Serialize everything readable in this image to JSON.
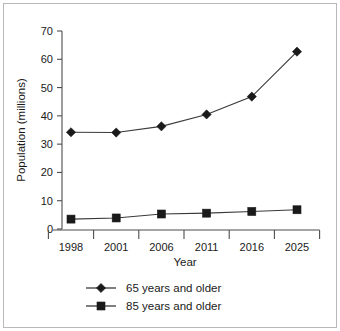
{
  "chart_data": {
    "type": "line",
    "title": "",
    "xlabel": "Year",
    "ylabel": "Population (millions)",
    "categories": [
      "1998",
      "2001",
      "2006",
      "2011",
      "2016",
      "2025"
    ],
    "ylim": [
      0,
      70
    ],
    "yticks": [
      "0",
      "10",
      "20",
      "30",
      "40",
      "50",
      "60",
      "70"
    ],
    "ytick_values": [
      0,
      10,
      20,
      30,
      40,
      50,
      60,
      70
    ],
    "grid": false,
    "legend_position": "bottom",
    "series": [
      {
        "name": "65 years and older",
        "marker": "diamond",
        "color": "#1a1a1a",
        "values": [
          34.2,
          34.1,
          36.3,
          40.5,
          46.8,
          62.7
        ]
      },
      {
        "name": "85 years and older",
        "marker": "square",
        "color": "#1a1a1a",
        "values": [
          3.5,
          3.9,
          5.3,
          5.6,
          6.2,
          6.8
        ]
      }
    ]
  },
  "legend": {
    "entries": [
      {
        "label": "65 years and older",
        "marker": "diamond"
      },
      {
        "label": "85 years and older",
        "marker": "square"
      }
    ]
  },
  "axes": {
    "x_title": "Year",
    "y_title": "Population (millions)"
  },
  "colors": {
    "ink": "#1a1a1a",
    "axis": "#4d4d4d",
    "line": "#3a3a3a",
    "frame": "#b8b8b8",
    "background": "#ffffff"
  }
}
